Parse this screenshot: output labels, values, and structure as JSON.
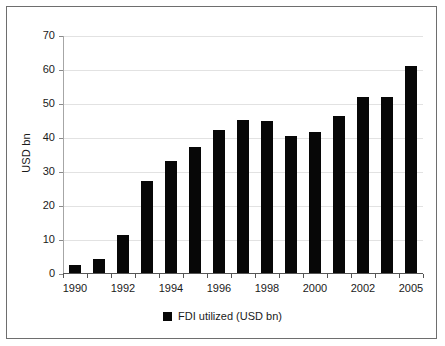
{
  "chart_data": {
    "type": "bar",
    "title": "",
    "subtitle": "",
    "xlabel": "",
    "ylabel": "USD bn",
    "ylim": [
      0,
      70
    ],
    "yticks": [
      0,
      10,
      20,
      30,
      40,
      50,
      60,
      70
    ],
    "grid": true,
    "legend_position": "bottom",
    "legend": [
      "FDI utilized (USD bn)"
    ],
    "series_color": "#070707",
    "categories": [
      "1990",
      "1991",
      "1992",
      "1993",
      "1994",
      "1995",
      "1996",
      "1997",
      "1998",
      "1999",
      "2000",
      "2001",
      "2002",
      "2003",
      "2005"
    ],
    "visible_tick_labels": [
      "1990",
      "1992",
      "1994",
      "1996",
      "1998",
      "2000",
      "2002",
      "2005"
    ],
    "series": [
      {
        "name": "FDI utilized (USD bn)",
        "values": [
          2.6,
          4.4,
          11.4,
          27.5,
          33.3,
          37.5,
          42.3,
          45.3,
          45.1,
          40.6,
          41.7,
          46.6,
          52.2,
          52.2,
          61.2
        ]
      }
    ]
  },
  "axis": {
    "y_title": "USD bn",
    "y_tick_labels": [
      "70",
      "60",
      "50",
      "40",
      "30",
      "20",
      "10",
      "0"
    ],
    "x_tick_labels": [
      "1990",
      "1992",
      "1994",
      "1996",
      "1998",
      "2000",
      "2002",
      "2005"
    ]
  },
  "legend": {
    "label": "FDI utilized (USD bn)",
    "swatch_color": "#070707"
  },
  "colors": {
    "bar": "#070707",
    "gridline": "#e2e2e2",
    "axis": "#555555",
    "frame": "#6e6e6e",
    "background": "#ffffff"
  }
}
